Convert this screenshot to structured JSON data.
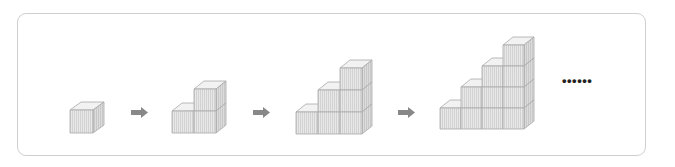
{
  "diagram": {
    "cube_style": {
      "front_fill": "#e6e6e6",
      "top_fill": "#f2f2f2",
      "side_fill": "#dadada",
      "stroke": "#a8a8a8",
      "stripe": "#cdcdcd"
    },
    "arrow_color": "#888888",
    "figures": [
      {
        "id": 1,
        "columns": [
          1
        ],
        "total_cubes": 1
      },
      {
        "id": 2,
        "columns": [
          1,
          2
        ],
        "total_cubes": 3
      },
      {
        "id": 3,
        "columns": [
          1,
          2,
          3
        ],
        "total_cubes": 6
      },
      {
        "id": 4,
        "columns": [
          1,
          2,
          3,
          4
        ],
        "total_cubes": 10
      }
    ],
    "arrows": [
      {
        "from": 1,
        "to": 2
      },
      {
        "from": 2,
        "to": 3
      },
      {
        "from": 3,
        "to": 4
      }
    ],
    "continuation": "••••••"
  }
}
